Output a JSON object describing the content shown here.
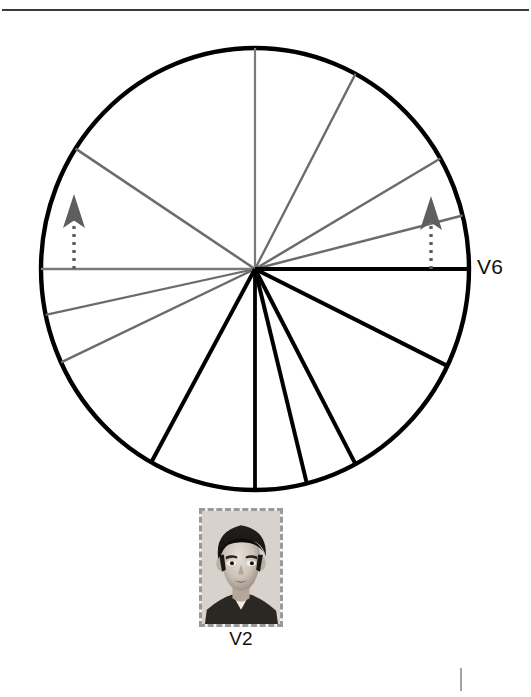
{
  "figure": {
    "background_color": "#ffffff",
    "width": 531,
    "height": 697,
    "top_rule": {
      "name": "horizontal-rule",
      "y": 10,
      "x1": 2,
      "x2": 529,
      "color": "#3a3a3a",
      "thickness": 2.2
    },
    "corner_tick": {
      "name": "page-corner-tick",
      "x": 461,
      "y1": 668,
      "y2": 691,
      "color": "#8d8d8d",
      "thickness": 1.6
    }
  },
  "circle": {
    "center_x": 255,
    "center_y": 269,
    "radius": 214,
    "radius_y": 221,
    "stroke_color": "#000000",
    "stroke_width": 4.4,
    "fill": "#ffffff"
  },
  "colors": {
    "black_spoke": "#000000",
    "gray_spoke": "#6b6b6b",
    "axis_black": "#000000",
    "axis_gray": "#7a7a7a",
    "arrow": "#5e5e5e",
    "rule": "#3a3a3a",
    "text": "#111111",
    "photo_border": "#9a9a9a"
  },
  "axes": [
    {
      "name": "axis-horizontal-right",
      "angle_deg": 0,
      "color": "#000000",
      "width": 4.0,
      "label": "V6"
    },
    {
      "name": "axis-horizontal-left",
      "angle_deg": 180,
      "color": "#7a7a7a",
      "width": 2.4,
      "label": ""
    },
    {
      "name": "axis-vertical-up",
      "angle_deg": 90,
      "color": "#7a7a7a",
      "width": 2.2,
      "label": ""
    },
    {
      "name": "axis-vertical-down",
      "angle_deg": 270,
      "color": "#000000",
      "width": 3.8,
      "label": ""
    }
  ],
  "spokes": [
    {
      "name": "spoke-gray-1",
      "angle_deg": 62,
      "color": "#6b6b6b",
      "width": 2.3
    },
    {
      "name": "spoke-gray-2",
      "angle_deg": 30,
      "color": "#6b6b6b",
      "width": 2.5
    },
    {
      "name": "spoke-gray-3",
      "angle_deg": 14,
      "color": "#6b6b6b",
      "width": 2.4
    },
    {
      "name": "spoke-gray-4",
      "angle_deg": 147,
      "color": "#6b6b6b",
      "width": 2.5
    },
    {
      "name": "spoke-gray-5",
      "angle_deg": 192,
      "color": "#6b6b6b",
      "width": 2.3
    },
    {
      "name": "spoke-gray-6",
      "angle_deg": 205,
      "color": "#6b6b6b",
      "width": 2.4
    },
    {
      "name": "spoke-black-1",
      "angle_deg": -26,
      "color": "#000000",
      "width": 4.0
    },
    {
      "name": "spoke-black-2",
      "angle_deg": -62,
      "color": "#000000",
      "width": 4.0
    },
    {
      "name": "spoke-black-3",
      "angle_deg": -76,
      "color": "#000000",
      "width": 4.0
    },
    {
      "name": "spoke-black-4",
      "angle_deg": -119,
      "color": "#000000",
      "width": 4.0
    }
  ],
  "arrows": [
    {
      "name": "arrow-left",
      "x": 74,
      "base_y": 269,
      "tip_y": 194,
      "color": "#5e5e5e",
      "dash": "3 5",
      "stem_width": 3.4,
      "head_width": 22,
      "head_height": 34
    },
    {
      "name": "arrow-right",
      "x": 431,
      "base_y": 269,
      "tip_y": 196,
      "color": "#5e5e5e",
      "dash": "3 5",
      "stem_width": 3.4,
      "head_width": 22,
      "head_height": 34
    }
  ],
  "labels": {
    "lead_v6": "V6",
    "photo_caption": "V2"
  },
  "photo": {
    "name": "portrait-photo",
    "alt_description": "black-and-white portrait photograph of a boy",
    "left": 199,
    "top": 508,
    "width": 84,
    "height": 119,
    "border_style": "dashed",
    "border_color": "#9a9a9a"
  },
  "chart_data": {
    "type": "scatter",
    "title": "",
    "subtitle": "",
    "xlabel": "",
    "ylabel": "",
    "annotations": [
      "V6",
      "V2"
    ],
    "legend_position": "none",
    "grid": false,
    "center": [
      255,
      269
    ],
    "radius": 214,
    "angle_unit": "degrees",
    "series": [
      {
        "name": "gray-spokes",
        "color": "#6b6b6b",
        "values": [
          62,
          30,
          14,
          147,
          192,
          205,
          180,
          90
        ]
      },
      {
        "name": "black-spokes",
        "color": "#000000",
        "values": [
          0,
          -26,
          -62,
          -76,
          -119,
          270
        ]
      }
    ],
    "arrow_markers": [
      {
        "name": "arrow-left",
        "x": 74,
        "y_base": 269,
        "y_tip": 194
      },
      {
        "name": "arrow-right",
        "x": 431,
        "y_base": 269,
        "y_tip": 196
      }
    ]
  }
}
